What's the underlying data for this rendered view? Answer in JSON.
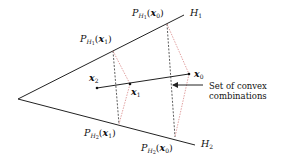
{
  "diagram": {
    "colors": {
      "lines": "#222222",
      "black_dashed": "#333333",
      "red_dotted": "#d98a8a"
    },
    "lines": {
      "H1": {
        "label_main": "H",
        "label_sub": "1"
      },
      "H2": {
        "label_main": "H",
        "label_sub": "2"
      }
    },
    "points": {
      "x0": {
        "main": "x",
        "sub": "0"
      },
      "x1": {
        "main": "x",
        "sub": "1"
      },
      "x2": {
        "main": "x",
        "sub": "2"
      }
    },
    "projections": {
      "PH1_x0": {
        "P": "P",
        "H": "H",
        "hsub": "1",
        "arg": "x",
        "argsub": "0"
      },
      "PH1_x1": {
        "P": "P",
        "H": "H",
        "hsub": "1",
        "arg": "x",
        "argsub": "1"
      },
      "PH2_x0": {
        "P": "P",
        "H": "H",
        "hsub": "2",
        "arg": "x",
        "argsub": "0"
      },
      "PH2_x1": {
        "P": "P",
        "H": "H",
        "hsub": "2",
        "arg": "x",
        "argsub": "1"
      }
    },
    "annotation": {
      "line1": "Set of convex",
      "line2": "combinations"
    }
  }
}
